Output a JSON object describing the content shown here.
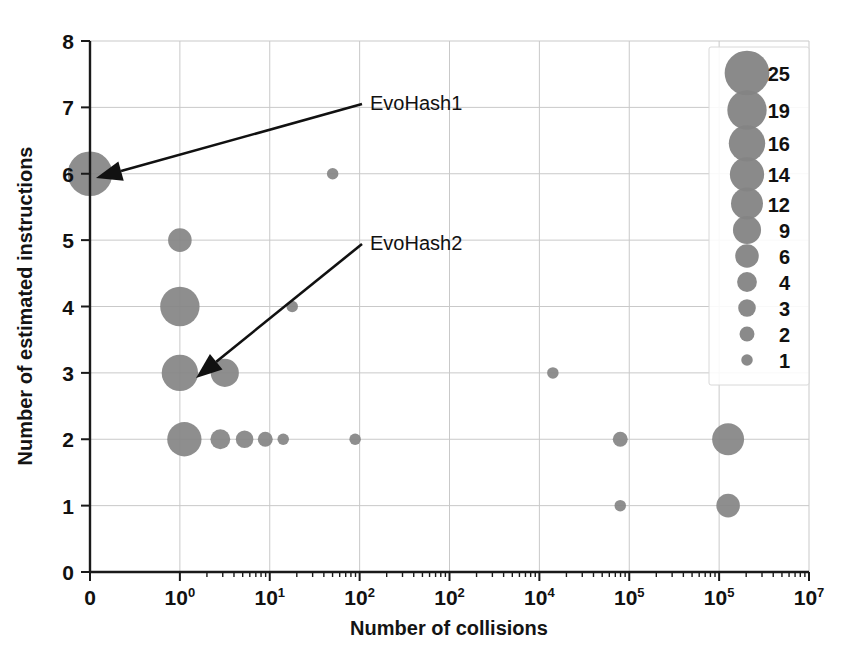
{
  "chart_data": {
    "type": "scatter",
    "title": "",
    "xlabel": "Number of collisions",
    "ylabel": "Number of estimated instructions",
    "xscale": "log",
    "yscale": "linear",
    "ylim": [
      0,
      8
    ],
    "grid": true,
    "xtick_labels": [
      "0",
      "10⁰",
      "10¹",
      "10²",
      "10²",
      "10⁴",
      "10⁵",
      "10⁵",
      "10⁷"
    ],
    "xtick_bases": [
      "0",
      "10",
      "10",
      "10",
      "10",
      "10",
      "10",
      "10",
      "10"
    ],
    "xtick_exponents": [
      "",
      "0",
      "1",
      "2",
      "2",
      "4",
      "5",
      "5",
      "7"
    ],
    "ytick_labels": [
      "0",
      "1",
      "2",
      "3",
      "4",
      "5",
      "6",
      "7",
      "8"
    ],
    "legend": {
      "title": "",
      "position": "top-right",
      "size_label": "bubble size = count",
      "entries": [
        {
          "label": "25",
          "size": 25
        },
        {
          "label": "19",
          "size": 19
        },
        {
          "label": "16",
          "size": 16
        },
        {
          "label": "14",
          "size": 14
        },
        {
          "label": "12",
          "size": 12
        },
        {
          "label": "9",
          "size": 9
        },
        {
          "label": "6",
          "size": 6
        },
        {
          "label": "4",
          "size": 4
        },
        {
          "label": "3",
          "size": 3
        },
        {
          "label": "2",
          "size": 2
        },
        {
          "label": "1",
          "size": 1
        }
      ]
    },
    "points": [
      {
        "x_tick": 0,
        "y": 6,
        "size": 25,
        "note": "EvoHash1"
      },
      {
        "x_tick": 2.7,
        "y": 6,
        "size": 1
      },
      {
        "x_tick": 1.0,
        "y": 5,
        "size": 6
      },
      {
        "x_tick": 1.0,
        "y": 4,
        "size": 19
      },
      {
        "x_tick": 2.25,
        "y": 4,
        "size": 1
      },
      {
        "x_tick": 1.0,
        "y": 3,
        "size": 16,
        "note": "EvoHash2"
      },
      {
        "x_tick": 1.5,
        "y": 3,
        "size": 9
      },
      {
        "x_tick": 5.15,
        "y": 3,
        "size": 1
      },
      {
        "x_tick": 1.05,
        "y": 2,
        "size": 14
      },
      {
        "x_tick": 1.45,
        "y": 2,
        "size": 4
      },
      {
        "x_tick": 1.72,
        "y": 2,
        "size": 3
      },
      {
        "x_tick": 1.95,
        "y": 2,
        "size": 2
      },
      {
        "x_tick": 2.15,
        "y": 2,
        "size": 1
      },
      {
        "x_tick": 2.95,
        "y": 2,
        "size": 1
      },
      {
        "x_tick": 5.9,
        "y": 2,
        "size": 2
      },
      {
        "x_tick": 7.1,
        "y": 2,
        "size": 12
      },
      {
        "x_tick": 5.9,
        "y": 1,
        "size": 1
      },
      {
        "x_tick": 7.1,
        "y": 1,
        "size": 6
      }
    ],
    "annotations": [
      {
        "label": "EvoHash1",
        "text_x": 370,
        "text_y": 110,
        "arrow_to_x": 96,
        "arrow_to_y": 178
      },
      {
        "label": "EvoHash2",
        "text_x": 370,
        "text_y": 250,
        "arrow_to_x": 196,
        "arrow_to_y": 378
      }
    ]
  },
  "colors": {
    "bubble": "#848484",
    "grid": "#c9c9c9",
    "axis": "#1a1a1a",
    "text": "#111111",
    "background": "#ffffff"
  }
}
